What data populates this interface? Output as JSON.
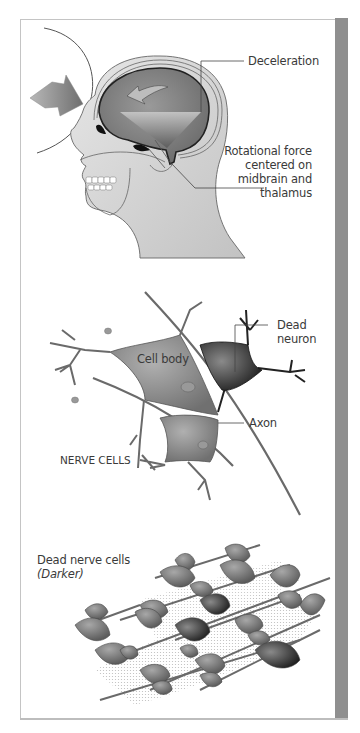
{
  "figure": {
    "panels": [
      {
        "id": "head",
        "title": "Head rotational injury",
        "labels": {
          "deceleration": "Deceleration",
          "rotational_line1": "Rotational force",
          "rotational_line2": "centered on",
          "rotational_line3": "midbrain and",
          "rotational_line4": "thalamus"
        }
      },
      {
        "id": "neurons",
        "title": "NERVE CELLS",
        "labels": {
          "cell_body": "Cell body",
          "dead_neuron_line1": "Dead",
          "dead_neuron_line2": "neuron",
          "axon": "Axon"
        }
      },
      {
        "id": "tissue",
        "labels": {
          "dead_cells": "Dead nerve cells",
          "darker": "(Darker)"
        }
      }
    ],
    "colors": {
      "frame_border": "#c4c4c4",
      "side_bar": "#8f8f8f",
      "skin": "#d6d6d6",
      "brain": "#7e7e7e",
      "neuron": "#8a8a8a",
      "dead_neuron": "#3a3a3a",
      "text": "#3a3a3a"
    }
  }
}
